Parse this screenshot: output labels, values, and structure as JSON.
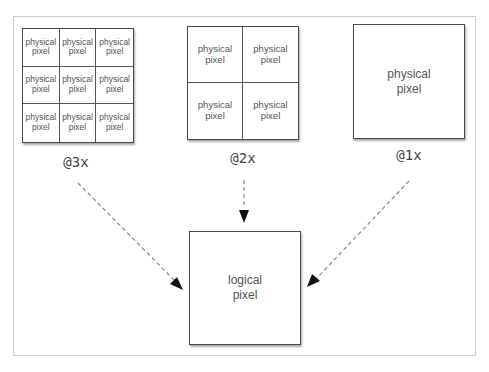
{
  "diagram": {
    "colors": {
      "box_border": "#4a4a4a",
      "cell_text": "#555555",
      "arrow": "#888888",
      "arrowhead": "#111111",
      "frame": "#cfcfcf"
    },
    "scales": [
      {
        "label": "@3x",
        "grid": "3x3",
        "cells": [
          {
            "line1": "physical",
            "line2": "pixel"
          },
          {
            "line1": "physical",
            "line2": "pixel"
          },
          {
            "line1": "physical",
            "line2": "pixel"
          },
          {
            "line1": "physical",
            "line2": "pixel"
          },
          {
            "line1": "physical",
            "line2": "pixel"
          },
          {
            "line1": "physical",
            "line2": "pixel"
          },
          {
            "line1": "physical",
            "line2": "pixel"
          },
          {
            "line1": "physical",
            "line2": "pixel"
          },
          {
            "line1": "physical",
            "line2": "pixel"
          }
        ]
      },
      {
        "label": "@2x",
        "grid": "2x2",
        "cells": [
          {
            "line1": "physical",
            "line2": "pixel"
          },
          {
            "line1": "physical",
            "line2": "pixel"
          },
          {
            "line1": "physical",
            "line2": "pixel"
          },
          {
            "line1": "physical",
            "line2": "pixel"
          }
        ]
      },
      {
        "label": "@1x",
        "grid": "1x1",
        "cells": [
          {
            "line1": "physical",
            "line2": "pixel"
          }
        ]
      }
    ],
    "target": {
      "line1": "logical",
      "line2": "pixel"
    },
    "edges": [
      {
        "from": "@3x",
        "to": "logical pixel",
        "style": "dashed"
      },
      {
        "from": "@2x",
        "to": "logical pixel",
        "style": "dashed"
      },
      {
        "from": "@1x",
        "to": "logical pixel",
        "style": "dashed"
      }
    ]
  }
}
